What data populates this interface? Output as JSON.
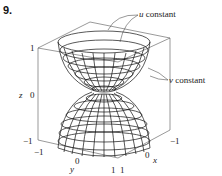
{
  "problem_number": "9.",
  "labels": {
    "u_var": "u",
    "v_var": "v",
    "constant": " constant"
  },
  "axes": {
    "z_label": "z",
    "x_label": "x",
    "y_label": "y",
    "z_ticks": [
      "1",
      "0",
      "−1"
    ],
    "y_ticks": [
      "−1",
      "0",
      "1"
    ],
    "x_ticks": [
      "1",
      "0",
      "−1"
    ]
  }
}
